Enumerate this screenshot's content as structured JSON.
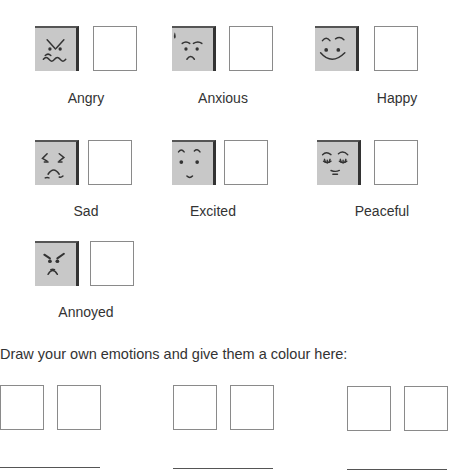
{
  "emotions": [
    {
      "label": "Angry",
      "icon": "angry-face-icon"
    },
    {
      "label": "Anxious",
      "icon": "anxious-face-icon"
    },
    {
      "label": "Happy",
      "icon": "happy-face-icon"
    },
    {
      "label": "Sad",
      "icon": "sad-face-icon"
    },
    {
      "label": "Excited",
      "icon": "excited-face-icon"
    },
    {
      "label": "Peaceful",
      "icon": "peaceful-face-icon"
    },
    {
      "label": "Annoyed",
      "icon": "annoyed-face-icon"
    }
  ],
  "custom_section": {
    "title": "Draw your own emotions and give them a colour here:",
    "slots": 3
  },
  "colors": {
    "face_fill": "#c8c8c8",
    "box_border": "#8a8a8a",
    "text": "#333333"
  }
}
